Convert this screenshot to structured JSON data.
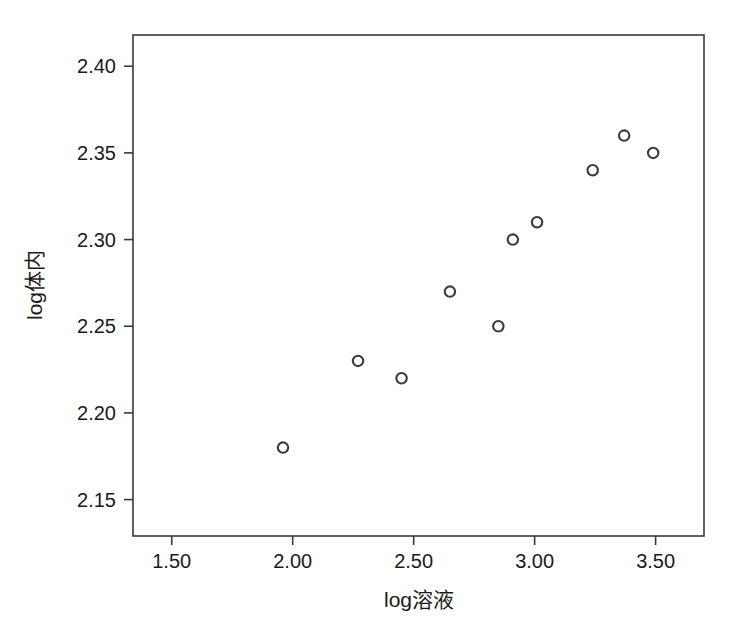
{
  "chart_data": {
    "type": "scatter",
    "title": "",
    "xlabel": "log溶液",
    "ylabel": "log体内",
    "xlim": [
      1.34,
      1.3
    ],
    "x_range": [
      1.34,
      3.7
    ],
    "y_range": [
      2.129,
      2.418
    ],
    "xticks": [
      "1.50",
      "2.00",
      "2.50",
      "3.00",
      "3.50"
    ],
    "xtick_values": [
      1.5,
      2.0,
      2.5,
      3.0,
      3.5
    ],
    "yticks": [
      "2.15",
      "2.20",
      "2.25",
      "2.30",
      "2.35",
      "2.40"
    ],
    "ytick_values": [
      2.15,
      2.2,
      2.25,
      2.3,
      2.35,
      2.4
    ],
    "grid": false,
    "legend": false,
    "marker": "open-circle",
    "marker_color": "#3c3c40",
    "points": [
      {
        "x": 1.96,
        "y": 2.18
      },
      {
        "x": 2.27,
        "y": 2.23
      },
      {
        "x": 2.45,
        "y": 2.22
      },
      {
        "x": 2.65,
        "y": 2.27
      },
      {
        "x": 2.85,
        "y": 2.25
      },
      {
        "x": 2.91,
        "y": 2.3
      },
      {
        "x": 3.01,
        "y": 2.31
      },
      {
        "x": 3.24,
        "y": 2.34
      },
      {
        "x": 3.37,
        "y": 2.36
      },
      {
        "x": 3.49,
        "y": 2.35
      }
    ]
  },
  "axes": {
    "x_axis_name": "log溶液",
    "y_axis_name": "log体内"
  }
}
